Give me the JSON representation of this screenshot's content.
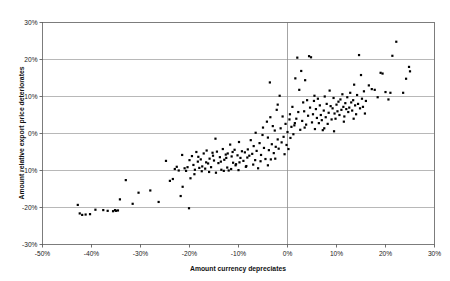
{
  "chart_data": {
    "type": "scatter",
    "title": "",
    "xlabel": "Amount currency depreciates",
    "ylabel": "Amount relative export price deteriorates",
    "xlim": [
      -50,
      30
    ],
    "ylim": [
      -30,
      30
    ],
    "xticks": [
      -50,
      -40,
      -30,
      -20,
      -10,
      0,
      10,
      20,
      30
    ],
    "xticklabels": [
      "-50%",
      "-40%",
      "-30%",
      "-20%",
      "-10%",
      "0%",
      "10%",
      "20%",
      "30%"
    ],
    "yticks": [
      -30,
      -20,
      -10,
      0,
      10,
      20,
      30
    ],
    "yticklabels": [
      "-30%",
      "-20%",
      "-10%",
      "0%",
      "10%",
      "20%",
      "30%"
    ],
    "grid": "horizontal-gridlines-plus-vertical-zero-line",
    "legend": "none",
    "marker": "filled-square",
    "marker_color": "#000000",
    "series": [
      {
        "name": "observations",
        "points": [
          [
            -42.8,
            -19.3
          ],
          [
            -42.4,
            -21.6
          ],
          [
            -41.9,
            -22.0
          ],
          [
            -41.2,
            -21.9
          ],
          [
            -40.3,
            -21.8
          ],
          [
            -39.2,
            -20.6
          ],
          [
            -37.6,
            -20.7
          ],
          [
            -36.7,
            -20.9
          ],
          [
            -35.6,
            -21.0
          ],
          [
            -35.2,
            -20.7
          ],
          [
            -35.0,
            -20.9
          ],
          [
            -34.6,
            -20.8
          ],
          [
            -34.2,
            -17.8
          ],
          [
            -33.0,
            -12.6
          ],
          [
            -31.6,
            -19.0
          ],
          [
            -30.4,
            -16.0
          ],
          [
            -28.0,
            -15.4
          ],
          [
            -26.3,
            -18.5
          ],
          [
            -24.8,
            -7.4
          ],
          [
            -24.0,
            -12.8
          ],
          [
            -23.4,
            -12.3
          ],
          [
            -23.0,
            -9.6
          ],
          [
            -22.6,
            -9.0
          ],
          [
            -22.2,
            -10.0
          ],
          [
            -21.8,
            -16.9
          ],
          [
            -21.4,
            -14.4
          ],
          [
            -21.0,
            -9.4
          ],
          [
            -20.7,
            -10.1
          ],
          [
            -20.4,
            -9.1
          ],
          [
            -20.1,
            -20.2
          ],
          [
            -19.8,
            -12.1
          ],
          [
            -19.5,
            -6.1
          ],
          [
            -19.2,
            -8.5
          ],
          [
            -18.9,
            -9.8
          ],
          [
            -18.6,
            -5.0
          ],
          [
            -18.3,
            -7.6
          ],
          [
            -18.0,
            -9.3
          ],
          [
            -17.7,
            -7.0
          ],
          [
            -17.4,
            -8.9
          ],
          [
            -17.1,
            -5.4
          ],
          [
            -16.8,
            -9.5
          ],
          [
            -16.5,
            -4.6
          ],
          [
            -16.2,
            -8.1
          ],
          [
            -15.9,
            -6.8
          ],
          [
            -15.6,
            -9.1
          ],
          [
            -15.3,
            -5.2
          ],
          [
            -15.0,
            -7.3
          ],
          [
            -14.7,
            -1.4
          ],
          [
            -14.4,
            -4.9
          ],
          [
            -14.1,
            -8.0
          ],
          [
            -13.8,
            -6.4
          ],
          [
            -13.5,
            -9.8
          ],
          [
            -13.2,
            -4.2
          ],
          [
            -12.9,
            -7.1
          ],
          [
            -12.6,
            -5.7
          ],
          [
            -12.3,
            -9.2
          ],
          [
            -12.0,
            -10.0
          ],
          [
            -11.7,
            -3.0
          ],
          [
            -11.4,
            -6.2
          ],
          [
            -11.1,
            -7.9
          ],
          [
            -10.8,
            -4.4
          ],
          [
            -10.5,
            -8.3
          ],
          [
            -10.2,
            -5.9
          ],
          [
            -9.9,
            -2.3
          ],
          [
            -9.6,
            -6.6
          ],
          [
            -9.3,
            -4.8
          ],
          [
            -9.0,
            -7.4
          ],
          [
            -8.7,
            -5.1
          ],
          [
            -8.4,
            -8.8
          ],
          [
            -8.1,
            -4.3
          ],
          [
            -7.8,
            -6.0
          ],
          [
            -7.5,
            -1.8
          ],
          [
            -7.2,
            -5.5
          ],
          [
            -6.9,
            -3.4
          ],
          [
            -6.6,
            -7.2
          ],
          [
            -6.3,
            -4.7
          ],
          [
            -6.0,
            -9.4
          ],
          [
            -5.7,
            -2.6
          ],
          [
            -5.4,
            -5.8
          ],
          [
            -5.1,
            -0.4
          ],
          [
            -4.8,
            -3.9
          ],
          [
            -4.5,
            -6.9
          ],
          [
            -4.2,
            3.2
          ],
          [
            -4.0,
            -1.1
          ],
          [
            -3.8,
            -4.5
          ],
          [
            -3.6,
            13.8
          ],
          [
            -3.4,
            -7.0
          ],
          [
            -3.2,
            -2.9
          ],
          [
            -3.0,
            2.0
          ],
          [
            -2.8,
            -5.3
          ],
          [
            -2.6,
            0.8
          ],
          [
            -2.4,
            -3.6
          ],
          [
            -2.2,
            6.4
          ],
          [
            -2.0,
            -1.6
          ],
          [
            -1.8,
            -4.1
          ],
          [
            -1.6,
            10.2
          ],
          [
            -1.4,
            1.4
          ],
          [
            -1.2,
            -2.4
          ],
          [
            -1.0,
            4.6
          ],
          [
            -0.8,
            -0.9
          ],
          [
            -0.6,
            -5.6
          ],
          [
            -0.4,
            2.6
          ],
          [
            -0.2,
            -3.1
          ],
          [
            0.0,
            0.4
          ],
          [
            0.2,
            -4.2
          ],
          [
            0.4,
            3.8
          ],
          [
            0.6,
            -1.2
          ],
          [
            0.8,
            1.8
          ],
          [
            1.0,
            7.2
          ],
          [
            1.2,
            -0.2
          ],
          [
            1.4,
            2.2
          ],
          [
            1.6,
            14.9
          ],
          [
            1.8,
            4.0
          ],
          [
            2.0,
            20.5
          ],
          [
            2.2,
            5.8
          ],
          [
            2.4,
            11.8
          ],
          [
            2.6,
            1.0
          ],
          [
            2.8,
            16.9
          ],
          [
            3.0,
            3.4
          ],
          [
            3.2,
            8.4
          ],
          [
            3.4,
            6.0
          ],
          [
            3.6,
            14.4
          ],
          [
            3.8,
            2.4
          ],
          [
            4.0,
            9.0
          ],
          [
            4.2,
            4.8
          ],
          [
            4.4,
            20.9
          ],
          [
            4.6,
            7.0
          ],
          [
            4.8,
            20.6
          ],
          [
            5.0,
            3.0
          ],
          [
            5.2,
            5.2
          ],
          [
            5.4,
            8.8
          ],
          [
            5.6,
            1.2
          ],
          [
            5.8,
            6.6
          ],
          [
            6.0,
            4.2
          ],
          [
            6.2,
            9.4
          ],
          [
            6.4,
            2.8
          ],
          [
            6.6,
            7.6
          ],
          [
            6.8,
            5.0
          ],
          [
            7.0,
            3.6
          ],
          [
            7.2,
            0.9
          ],
          [
            7.4,
            6.2
          ],
          [
            7.6,
            10.0
          ],
          [
            7.8,
            4.4
          ],
          [
            8.0,
            8.0
          ],
          [
            8.2,
            2.6
          ],
          [
            8.4,
            5.6
          ],
          [
            8.6,
            11.6
          ],
          [
            8.8,
            7.4
          ],
          [
            9.0,
            3.8
          ],
          [
            9.2,
            6.8
          ],
          [
            9.4,
            9.6
          ],
          [
            9.6,
            5.4
          ],
          [
            9.8,
            4.0
          ],
          [
            10.0,
            7.8
          ],
          [
            10.2,
            6.0
          ],
          [
            10.4,
            8.6
          ],
          [
            10.6,
            5.0
          ],
          [
            10.8,
            9.2
          ],
          [
            11.0,
            6.4
          ],
          [
            11.2,
            10.6
          ],
          [
            11.4,
            7.2
          ],
          [
            11.6,
            4.6
          ],
          [
            11.8,
            8.2
          ],
          [
            12.0,
            6.6
          ],
          [
            12.2,
            9.8
          ],
          [
            12.4,
            5.8
          ],
          [
            12.6,
            7.0
          ],
          [
            12.8,
            11.0
          ],
          [
            13.0,
            8.4
          ],
          [
            13.2,
            6.2
          ],
          [
            13.4,
            9.0
          ],
          [
            13.6,
            13.2
          ],
          [
            13.8,
            7.6
          ],
          [
            14.0,
            5.2
          ],
          [
            14.2,
            10.4
          ],
          [
            14.4,
            8.0
          ],
          [
            14.6,
            21.2
          ],
          [
            14.8,
            6.8
          ],
          [
            15.0,
            15.8
          ],
          [
            15.2,
            9.4
          ],
          [
            15.4,
            7.2
          ],
          [
            15.6,
            11.4
          ],
          [
            15.8,
            5.4
          ],
          [
            16.0,
            8.8
          ],
          [
            16.6,
            13.0
          ],
          [
            17.2,
            12.0
          ],
          [
            17.8,
            11.8
          ],
          [
            18.4,
            9.8
          ],
          [
            19.0,
            16.4
          ],
          [
            19.4,
            16.2
          ],
          [
            20.0,
            11.2
          ],
          [
            20.6,
            9.2
          ],
          [
            21.0,
            11.0
          ],
          [
            21.4,
            21.0
          ],
          [
            22.2,
            24.8
          ],
          [
            23.6,
            11.0
          ],
          [
            24.2,
            14.8
          ],
          [
            24.8,
            18.0
          ],
          [
            25.0,
            16.8
          ],
          [
            -19.0,
            -11.0
          ],
          [
            -17.5,
            -10.2
          ],
          [
            -16.0,
            -10.4
          ],
          [
            -14.6,
            -10.6
          ],
          [
            -13.0,
            -10.1
          ],
          [
            -11.5,
            -9.6
          ],
          [
            -10.0,
            -9.9
          ],
          [
            -8.5,
            -9.0
          ],
          [
            -12.5,
            -6.6
          ],
          [
            -11.2,
            -5.0
          ],
          [
            -9.8,
            -7.8
          ],
          [
            -8.2,
            -6.5
          ],
          [
            -7.0,
            -8.4
          ],
          [
            -5.5,
            -7.5
          ],
          [
            -4.0,
            -8.6
          ],
          [
            -2.5,
            -6.8
          ],
          [
            -21.5,
            -5.8
          ],
          [
            -20.0,
            -7.2
          ],
          [
            -18.2,
            -6.3
          ],
          [
            -16.6,
            -7.8
          ],
          [
            -15.2,
            -6.0
          ],
          [
            -13.6,
            -7.6
          ],
          [
            -12.2,
            -5.4
          ],
          [
            -10.6,
            -8.6
          ],
          [
            -6.5,
            0.2
          ],
          [
            -5.0,
            1.6
          ],
          [
            -3.5,
            4.4
          ],
          [
            -2.0,
            7.8
          ],
          [
            0.5,
            5.2
          ],
          [
            1.5,
            2.8
          ],
          [
            3.5,
            1.6
          ],
          [
            5.5,
            10.2
          ],
          [
            7.5,
            1.4
          ],
          [
            9.5,
            0.6
          ],
          [
            11.5,
            3.2
          ],
          [
            13.5,
            4.0
          ]
        ]
      }
    ]
  },
  "axis": {
    "x_title": "Amount currency depreciates",
    "y_title": "Amount relative export price deteriorates"
  }
}
